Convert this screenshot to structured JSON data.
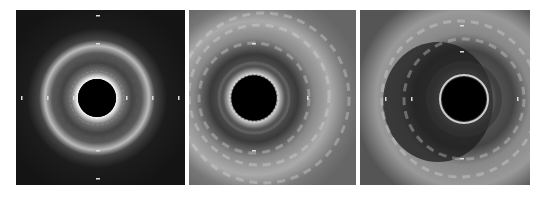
{
  "figure": {
    "background": "#ffffff",
    "panels": [
      {
        "id": "panel-1",
        "x": 16,
        "y": 10,
        "w": 169,
        "h": 175,
        "lumen": {
          "cx": 81,
          "cy": 88,
          "r": 19
        },
        "tone": "dark"
      },
      {
        "id": "panel-2",
        "x": 189,
        "y": 10,
        "w": 167,
        "h": 175,
        "lumen": {
          "cx": 65,
          "cy": 88,
          "r": 22
        },
        "tone": "bright"
      },
      {
        "id": "panel-3",
        "x": 360,
        "y": 10,
        "w": 170,
        "h": 175,
        "lumen": {
          "cx": 104,
          "cy": 89,
          "r": 22
        },
        "tone": "bright-eccentric"
      }
    ]
  }
}
